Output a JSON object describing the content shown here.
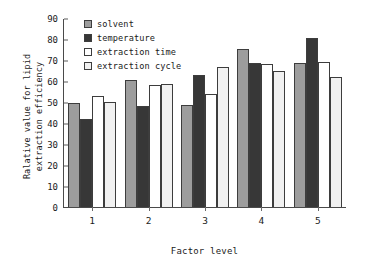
{
  "chart_data": {
    "type": "bar",
    "title": "",
    "xlabel": "Factor level",
    "ylabel": "Ralative value for lipid\nextraction efficiency",
    "categories": [
      "1",
      "2",
      "3",
      "4",
      "5"
    ],
    "series": [
      {
        "name": "solvent",
        "color": "#9d9d9d",
        "values": [
          49.4,
          60.7,
          48.8,
          75.1,
          68.4
        ]
      },
      {
        "name": "temperature",
        "color": "#373737",
        "values": [
          42.1,
          48.2,
          63.0,
          68.8,
          80.5
        ]
      },
      {
        "name": "extraction time",
        "color": "#ffffff",
        "values": [
          52.9,
          58.0,
          53.6,
          67.9,
          69.1
        ]
      },
      {
        "name": "extraction cycle",
        "color": "#f1f1f1",
        "values": [
          50.1,
          58.4,
          66.8,
          64.7,
          61.7
        ]
      }
    ],
    "ylim": [
      0,
      90
    ],
    "yticks": [
      0,
      10,
      20,
      30,
      40,
      50,
      60,
      70,
      80,
      90
    ],
    "ytick_labels": [
      "0",
      "10",
      "20",
      "30",
      "40",
      "50",
      "60",
      "70",
      "80",
      "90"
    ],
    "grid": false,
    "legend_position": "top-left-inside"
  },
  "axis": {
    "y_title": "Ralative value for lipid\nextraction efficiency",
    "x_title": "Factor level"
  },
  "legend": {
    "items": [
      {
        "label": "solvent"
      },
      {
        "label": "temperature"
      },
      {
        "label": "extraction time"
      },
      {
        "label": "extraction cycle"
      }
    ]
  },
  "caption": {
    "text": ""
  }
}
